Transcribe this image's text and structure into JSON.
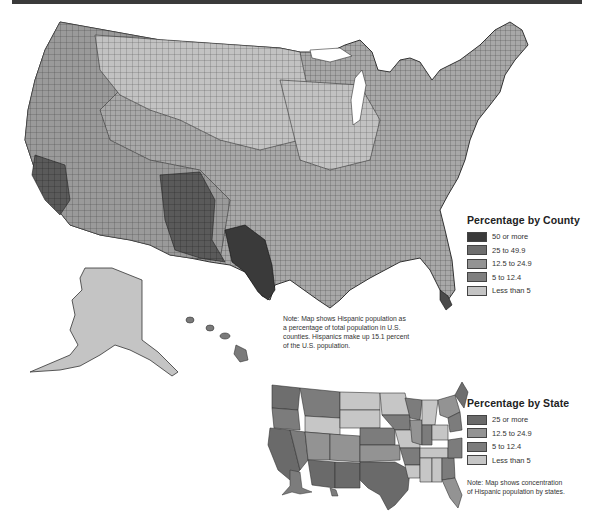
{
  "county_map": {
    "note": "Note: Map shows Hispanic population as a percentage of total population in U.S. counties. Hispanics make up 15.1 percent of the U.S. population.",
    "note_lines": [
      "Note: Map shows Hispanic population as",
      "a percentage of total population in U.S.",
      "counties. Hispanics make up 15.1 percent",
      "of the U.S. population."
    ],
    "legend": {
      "title": "Percentage by County",
      "items": [
        {
          "label": "50 or more",
          "color": "#3a3a3a"
        },
        {
          "label": "25 to 49.9",
          "color": "#6e6e6e"
        },
        {
          "label": "12.5 to 24.9",
          "color": "#939393"
        },
        {
          "label": "5 to 12.4",
          "color": "#7f7f7f"
        },
        {
          "label": "Less than 5",
          "color": "#c4c4c4"
        }
      ]
    }
  },
  "state_map": {
    "note_lines": [
      "Note: Map shows concentration",
      "of Hispanic population by states."
    ],
    "legend": {
      "title": "Percentage by State",
      "items": [
        {
          "label": "25 or more",
          "color": "#6a6a6a"
        },
        {
          "label": "12.5 to 24.9",
          "color": "#939393"
        },
        {
          "label": "5 to 12.4",
          "color": "#7c7c7c"
        },
        {
          "label": "Less than 5",
          "color": "#c6c6c6"
        }
      ]
    }
  },
  "colors": {
    "top_bar": "#3a3a3a",
    "outline": "#333333"
  }
}
